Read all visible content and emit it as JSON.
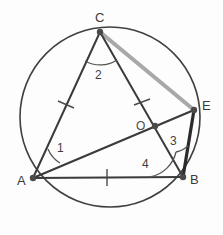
{
  "figure": {
    "background_color": "#fdfdfd"
  },
  "colors": {
    "stroke_dark": "#3b3b3b",
    "stroke_black": "#2b2b2b",
    "stroke_gray": "#a8a8a8",
    "circle_stroke": "#404040",
    "label_color": "#3a3a3a",
    "vertex_dot": "#4a4a4a"
  },
  "circle": {
    "name": "circumscribed-circle",
    "cx": 110,
    "cy": 117,
    "r": 90,
    "stroke_width": 1.6
  },
  "points": [
    {
      "id": "A",
      "label": "A",
      "x": 33,
      "y": 178,
      "label_x": 21,
      "label_y": 184,
      "on_circle": true
    },
    {
      "id": "B",
      "label": "B",
      "x": 183,
      "y": 177,
      "label_x": 192,
      "label_y": 183,
      "on_circle": true
    },
    {
      "id": "C",
      "label": "C",
      "x": 100,
      "y": 32,
      "label_x": 96,
      "label_y": 22,
      "on_circle": true
    },
    {
      "id": "E",
      "label": "E",
      "x": 194,
      "y": 110,
      "label_x": 203,
      "label_y": 109,
      "on_circle": true
    },
    {
      "id": "O",
      "label": "O",
      "x": 155,
      "y": 126,
      "label_x": 139,
      "label_y": 129,
      "on_circle": false
    }
  ],
  "segments": [
    {
      "name": "segment-AC",
      "from": "A",
      "to": "C",
      "x1": 33,
      "y1": 178,
      "x2": 100,
      "y2": 32,
      "color": "#3b3b3b",
      "width": 2.0
    },
    {
      "name": "segment-AB",
      "from": "A",
      "to": "B",
      "x1": 33,
      "y1": 178,
      "x2": 183,
      "y2": 177,
      "color": "#3b3b3b",
      "width": 2.2
    },
    {
      "name": "segment-CB",
      "from": "C",
      "to": "B",
      "x1": 100,
      "y1": 32,
      "x2": 183,
      "y2": 177,
      "color": "#3b3b3b",
      "width": 2.0
    },
    {
      "name": "segment-AE",
      "from": "A",
      "to": "E",
      "x1": 33,
      "y1": 178,
      "x2": 194,
      "y2": 110,
      "color": "#3b3b3b",
      "width": 2.2
    },
    {
      "name": "segment-EB",
      "from": "E",
      "to": "B",
      "x1": 194,
      "y1": 110,
      "x2": 183,
      "y2": 177,
      "color": "#2b2b2b",
      "width": 3.2
    },
    {
      "name": "segment-CE",
      "from": "C",
      "to": "E",
      "x1": 100,
      "y1": 32,
      "x2": 194,
      "y2": 110,
      "color": "#a8a8a8",
      "width": 4.0
    }
  ],
  "tick_marks": [
    {
      "name": "tick-on-AC",
      "x": 66,
      "y": 105,
      "angle": -25
    },
    {
      "name": "tick-on-CO",
      "x": 142,
      "y": 104,
      "angle": 30
    },
    {
      "name": "tick-on-AB",
      "x": 107,
      "y": 177,
      "angle": 0
    }
  ],
  "angles": [
    {
      "name": "angle-1-at-A",
      "label": "1",
      "vertex": "A",
      "label_x": 61,
      "label_y": 149,
      "arc": "M 57 165 A 26 26 0 0 1 48 152",
      "arc_r": 26
    },
    {
      "name": "angle-2-at-C",
      "label": "2",
      "vertex": "C",
      "label_x": 97,
      "label_y": 77,
      "arc": "M 86 62 A 32 32 0 0 0 117 61",
      "arc_r": 32
    },
    {
      "name": "angle-3-at-B",
      "label": "3",
      "vertex": "B",
      "label_x": 172,
      "label_y": 143,
      "arc": "M 179 150 A 28 28 0 0 0 186 149",
      "arc_r": 28
    },
    {
      "name": "angle-4-at-B",
      "label": "4",
      "vertex": "B",
      "label_x": 144,
      "label_y": 166,
      "arc": "M 150 177 A 33 33 0 0 0 179 145",
      "arc_r": 33
    }
  ],
  "labels": {
    "vertex_A": "A",
    "vertex_B": "B",
    "vertex_C": "C",
    "vertex_E": "E",
    "center_O": "O",
    "angle_1": "1",
    "angle_2": "2",
    "angle_3": "3",
    "angle_4": "4"
  }
}
